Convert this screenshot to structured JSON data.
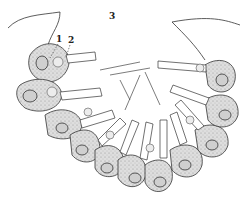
{
  "figure": {
    "number": "3",
    "labels": [
      "1",
      "2"
    ],
    "colors": {
      "ink": "#222222",
      "cell_fill": "#d9d9d9",
      "background": "#ffffff"
    }
  }
}
